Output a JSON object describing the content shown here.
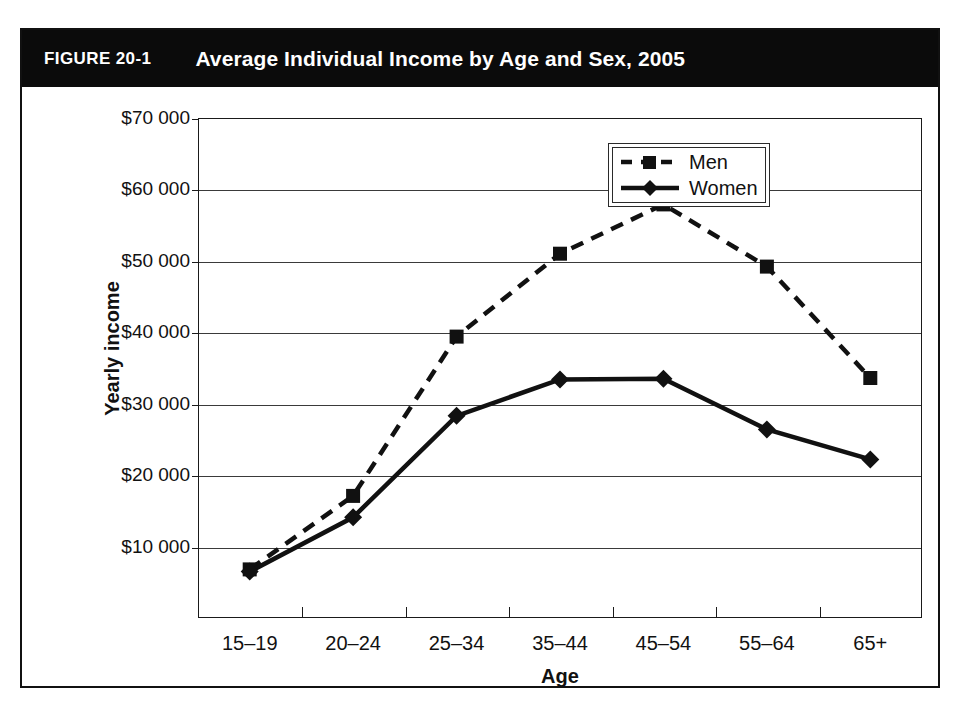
{
  "figure": {
    "number": "FIGURE 20-1",
    "title": "Average Individual Income by Age and Sex, 2005"
  },
  "colors": {
    "title_bar_bg": "#0b0b0b",
    "title_text": "#ffffff",
    "ink": "#111111",
    "gridline": "#3a3a3a",
    "plot_bg": "#ffffff"
  },
  "chart_data": {
    "type": "line",
    "title": "Average Individual Income by Age and Sex, 2005",
    "xlabel": "Age",
    "ylabel": "Yearly income",
    "categories": [
      "15–19",
      "20–24",
      "25–34",
      "35–44",
      "45–54",
      "55–64",
      "65+"
    ],
    "ylim": [
      0,
      70000
    ],
    "yticks": [
      10000,
      20000,
      30000,
      40000,
      50000,
      60000,
      70000
    ],
    "ytick_labels": [
      "$10 000",
      "$20 000",
      "$30 000",
      "$40 000",
      "$50 000",
      "$60 000",
      "$70 000"
    ],
    "grid": true,
    "legend_position": "top-right",
    "series": [
      {
        "name": "Men",
        "line_style": "dashed",
        "marker": "square",
        "values": [
          6800,
          17100,
          39400,
          51000,
          57900,
          49200,
          33600
        ]
      },
      {
        "name": "Women",
        "line_style": "solid",
        "marker": "diamond",
        "values": [
          6500,
          14100,
          28300,
          33400,
          33500,
          26400,
          22200
        ]
      }
    ]
  }
}
